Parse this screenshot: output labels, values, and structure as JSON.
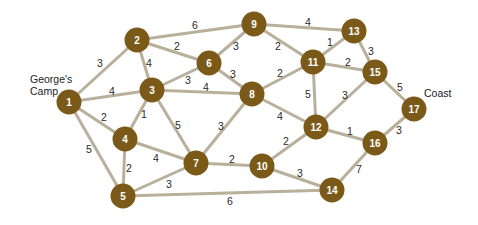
{
  "places": {
    "start": {
      "label": "George's\nCamp"
    },
    "end": {
      "label": "Coast"
    }
  },
  "colors": {
    "node": "#7b5a19",
    "edge": "#b9b09c",
    "node_text": "#ffffff"
  },
  "nodes": [
    {
      "id": "1",
      "x": 69,
      "y": 102
    },
    {
      "id": "2",
      "x": 137,
      "y": 40
    },
    {
      "id": "3",
      "x": 152,
      "y": 90
    },
    {
      "id": "4",
      "x": 125,
      "y": 139
    },
    {
      "id": "5",
      "x": 123,
      "y": 196
    },
    {
      "id": "6",
      "x": 209,
      "y": 63
    },
    {
      "id": "7",
      "x": 196,
      "y": 163
    },
    {
      "id": "8",
      "x": 252,
      "y": 94
    },
    {
      "id": "9",
      "x": 254,
      "y": 24
    },
    {
      "id": "10",
      "x": 262,
      "y": 166
    },
    {
      "id": "11",
      "x": 313,
      "y": 62
    },
    {
      "id": "12",
      "x": 316,
      "y": 127
    },
    {
      "id": "13",
      "x": 354,
      "y": 31
    },
    {
      "id": "14",
      "x": 332,
      "y": 190
    },
    {
      "id": "15",
      "x": 375,
      "y": 72
    },
    {
      "id": "16",
      "x": 375,
      "y": 143
    },
    {
      "id": "17",
      "x": 414,
      "y": 109
    }
  ],
  "edges": [
    {
      "from": "1",
      "to": "2",
      "weight": "3",
      "lx": 100,
      "ly": 63
    },
    {
      "from": "1",
      "to": "3",
      "weight": "4",
      "lx": 112,
      "ly": 91
    },
    {
      "from": "1",
      "to": "4",
      "weight": "2",
      "lx": 104,
      "ly": 117
    },
    {
      "from": "1",
      "to": "5",
      "weight": "5",
      "lx": 89,
      "ly": 149
    },
    {
      "from": "2",
      "to": "3",
      "weight": "4",
      "lx": 149,
      "ly": 63
    },
    {
      "from": "2",
      "to": "6",
      "weight": "2",
      "lx": 177,
      "ly": 46
    },
    {
      "from": "2",
      "to": "9",
      "weight": "6",
      "lx": 195,
      "ly": 25
    },
    {
      "from": "3",
      "to": "4",
      "weight": "1",
      "lx": 144,
      "ly": 114
    },
    {
      "from": "3",
      "to": "6",
      "weight": "3",
      "lx": 188,
      "ly": 80
    },
    {
      "from": "3",
      "to": "7",
      "weight": "5",
      "lx": 178,
      "ly": 125
    },
    {
      "from": "3",
      "to": "8",
      "weight": "4",
      "lx": 206,
      "ly": 87
    },
    {
      "from": "4",
      "to": "5",
      "weight": "2",
      "lx": 129,
      "ly": 168
    },
    {
      "from": "4",
      "to": "7",
      "weight": "4",
      "lx": 156,
      "ly": 158
    },
    {
      "from": "5",
      "to": "7",
      "weight": "3",
      "lx": 169,
      "ly": 184
    },
    {
      "from": "5",
      "to": "14",
      "weight": "6",
      "lx": 230,
      "ly": 201
    },
    {
      "from": "6",
      "to": "8",
      "weight": "3",
      "lx": 233,
      "ly": 74
    },
    {
      "from": "6",
      "to": "9",
      "weight": "3",
      "lx": 236,
      "ly": 46
    },
    {
      "from": "7",
      "to": "8",
      "weight": "3",
      "lx": 221,
      "ly": 126
    },
    {
      "from": "7",
      "to": "10",
      "weight": "2",
      "lx": 232,
      "ly": 159
    },
    {
      "from": "8",
      "to": "11",
      "weight": "2",
      "lx": 280,
      "ly": 73
    },
    {
      "from": "8",
      "to": "12",
      "weight": "4",
      "lx": 280,
      "ly": 116
    },
    {
      "from": "9",
      "to": "11",
      "weight": "2",
      "lx": 278,
      "ly": 46
    },
    {
      "from": "9",
      "to": "13",
      "weight": "4",
      "lx": 308,
      "ly": 22
    },
    {
      "from": "10",
      "to": "12",
      "weight": "2",
      "lx": 286,
      "ly": 141
    },
    {
      "from": "10",
      "to": "14",
      "weight": "3",
      "lx": 300,
      "ly": 173
    },
    {
      "from": "11",
      "to": "12",
      "weight": "5",
      "lx": 308,
      "ly": 94
    },
    {
      "from": "11",
      "to": "13",
      "weight": "1",
      "lx": 330,
      "ly": 42
    },
    {
      "from": "11",
      "to": "15",
      "weight": "2",
      "lx": 348,
      "ly": 62
    },
    {
      "from": "12",
      "to": "15",
      "weight": "3",
      "lx": 345,
      "ly": 95
    },
    {
      "from": "12",
      "to": "16",
      "weight": "1",
      "lx": 350,
      "ly": 131
    },
    {
      "from": "13",
      "to": "15",
      "weight": "3",
      "lx": 371,
      "ly": 51
    },
    {
      "from": "14",
      "to": "16",
      "weight": "7",
      "lx": 359,
      "ly": 169
    },
    {
      "from": "15",
      "to": "17",
      "weight": "5",
      "lx": 400,
      "ly": 87
    },
    {
      "from": "16",
      "to": "17",
      "weight": "3",
      "lx": 399,
      "ly": 130
    }
  ]
}
